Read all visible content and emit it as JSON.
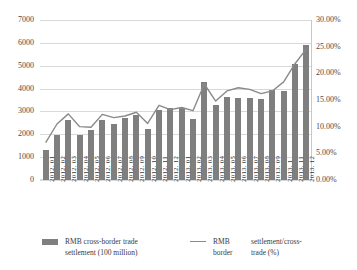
{
  "chart_data": {
    "type": "bar",
    "title": "",
    "xlabel": "",
    "ylabel": "",
    "grid": true,
    "legend_position": "bottom",
    "categories": [
      "2012. 01",
      "2012. 02",
      "2012. 03",
      "2012. 04",
      "2012. 05",
      "2012. 06",
      "2012. 07",
      "2012. 08",
      "2012. 09",
      "2012. 10",
      "2012. 11",
      "2012. 12",
      "2013. 01",
      "2013. 02",
      "2013. 03",
      "2013. 04",
      "2013. 05",
      "2013. 06",
      "2013. 07",
      "2013. 08",
      "2013. 09",
      "2013. 1",
      "2013. 11",
      "2013. 12"
    ],
    "series": [
      {
        "name": "RMB cross-border trade settlement (100 million)",
        "type": "bar",
        "axis": "left",
        "color": "#7f7f7f",
        "values": [
          1300,
          1950,
          2620,
          1980,
          2180,
          2610,
          2450,
          2720,
          2850,
          2250,
          3050,
          3150,
          3130,
          2660,
          4300,
          3280,
          3650,
          3570,
          3600,
          3550,
          3940,
          3910,
          5070,
          5890
        ]
      },
      {
        "name": "RMB settlement/cross-border trade (%)",
        "type": "line",
        "axis": "right",
        "color": "#8a8a8a",
        "values": [
          7.0,
          10.5,
          12.4,
          10.0,
          9.9,
          12.3,
          11.7,
          12.0,
          12.7,
          10.6,
          14.0,
          13.2,
          13.6,
          13.0,
          18.0,
          14.8,
          16.7,
          17.3,
          17.0,
          16.2,
          16.7,
          18.4,
          21.8,
          24.6
        ]
      }
    ],
    "ylim": [
      0,
      7000
    ],
    "y_ticks": [
      "0",
      "1000",
      "2000",
      "3000",
      "4000",
      "5000",
      "6000",
      "7000"
    ],
    "y2lim": [
      0,
      30
    ],
    "y2_ticks": [
      "0.00%",
      "5.00%",
      "10.00%",
      "15.00%",
      "20.00%",
      "25.00%",
      "30.00%"
    ]
  },
  "legend": {
    "bar_label_line1": "RMB cross-border trade",
    "bar_label_line2": "settlement (100 million)",
    "line_label_col1_line1": "RMB",
    "line_label_col1_line2": "border",
    "line_label_col2_line1": "settlement/cross-",
    "line_label_col2_line2": "trade (%)"
  }
}
